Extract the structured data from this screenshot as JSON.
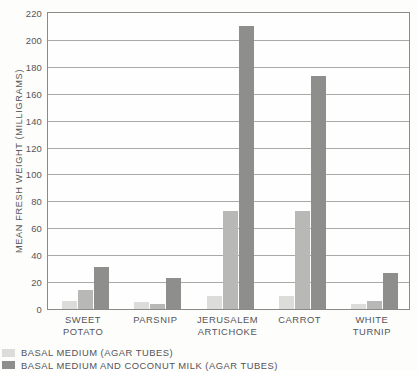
{
  "chart_data": {
    "type": "bar",
    "title": "",
    "xlabel": "",
    "ylabel": "MEAN FRESH WEIGHT (MILLIGRAMS)",
    "ylim": [
      0,
      220
    ],
    "ytick_step": 20,
    "yticks": [
      "0",
      "20",
      "40",
      "60",
      "80",
      "100",
      "120",
      "140",
      "160",
      "180",
      "200",
      "220"
    ],
    "grid": true,
    "legend_position": "below-left",
    "categories": [
      "SWEET\nPOTATO",
      "PARSNIP",
      "JERUSALEM\nARTICHOKE",
      "CARROT",
      "WHITE\nTURNIP"
    ],
    "series": [
      {
        "name": "",
        "color": "#dcdcda",
        "values": [
          6,
          5,
          10,
          10,
          4
        ]
      },
      {
        "name": "BASAL MEDIUM (AGAR TUBES)",
        "color": "#b8b8b6",
        "values": [
          14,
          4,
          73,
          73,
          6
        ]
      },
      {
        "name": "BASAL MEDIUM AND COCONUT MILK (AGAR TUBES)",
        "color": "#8e8e8c",
        "values": [
          31,
          23,
          210,
          173,
          27
        ]
      }
    ]
  },
  "legend": {
    "items": [
      {
        "label": "BASAL MEDIUM (AGAR TUBES)",
        "color": "#dcdcda"
      },
      {
        "label": "BASAL MEDIUM AND COCONUT MILK (AGAR TUBES)",
        "color": "#8e8e8c"
      }
    ]
  }
}
